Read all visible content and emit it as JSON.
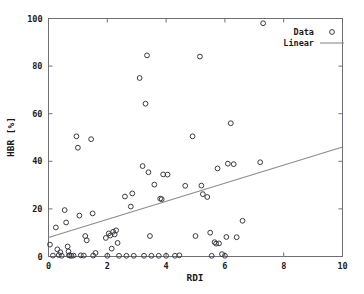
{
  "chart_data": {
    "type": "scatter",
    "title": "",
    "xlabel": "RDI",
    "ylabel": "HBR [%]",
    "xlim": [
      0,
      10
    ],
    "ylim": [
      0,
      100
    ],
    "xticks": [
      0,
      2,
      4,
      6,
      8,
      10
    ],
    "yticks": [
      0,
      20,
      40,
      60,
      80,
      100
    ],
    "xticklabels": [
      "0",
      "2",
      "4",
      "6",
      "8",
      "10"
    ],
    "yticklabels": [
      "0",
      "20",
      "40",
      "60",
      "80",
      "100"
    ],
    "grid": false,
    "legend_position": "upper right",
    "series": [
      {
        "name": "Data",
        "type": "scatter",
        "marker": "circle-open",
        "color": "#3a3a44",
        "points": [
          [
            0.05,
            5.0
          ],
          [
            0.15,
            0.4
          ],
          [
            0.25,
            12.2
          ],
          [
            0.3,
            3.0
          ],
          [
            0.35,
            0.6
          ],
          [
            0.4,
            1.8
          ],
          [
            0.45,
            0.3
          ],
          [
            0.55,
            19.5
          ],
          [
            0.6,
            14.3
          ],
          [
            0.65,
            4.2
          ],
          [
            0.68,
            2.1
          ],
          [
            0.7,
            0.5
          ],
          [
            0.72,
            0.4
          ],
          [
            0.78,
            0.3
          ],
          [
            0.85,
            0.4
          ],
          [
            0.95,
            50.5
          ],
          [
            1.0,
            45.7
          ],
          [
            1.05,
            17.2
          ],
          [
            1.1,
            0.5
          ],
          [
            1.2,
            0.4
          ],
          [
            1.25,
            8.6
          ],
          [
            1.3,
            6.8
          ],
          [
            1.45,
            49.3
          ],
          [
            1.5,
            18.1
          ],
          [
            1.52,
            0.4
          ],
          [
            1.6,
            1.5
          ],
          [
            1.95,
            7.8
          ],
          [
            2.0,
            0.3
          ],
          [
            2.05,
            9.7
          ],
          [
            2.1,
            8.8
          ],
          [
            2.15,
            3.3
          ],
          [
            2.2,
            10.4
          ],
          [
            2.25,
            9.3
          ],
          [
            2.3,
            11.0
          ],
          [
            2.35,
            5.7
          ],
          [
            2.4,
            0.3
          ],
          [
            2.6,
            25.2
          ],
          [
            2.65,
            0.3
          ],
          [
            2.8,
            21.0
          ],
          [
            2.85,
            26.5
          ],
          [
            2.9,
            0.3
          ],
          [
            3.1,
            75.0
          ],
          [
            3.2,
            38.0
          ],
          [
            3.25,
            0.3
          ],
          [
            3.3,
            64.2
          ],
          [
            3.35,
            84.5
          ],
          [
            3.4,
            35.4
          ],
          [
            3.45,
            8.6
          ],
          [
            3.5,
            0.3
          ],
          [
            3.6,
            30.2
          ],
          [
            3.75,
            0.3
          ],
          [
            3.8,
            24.3
          ],
          [
            3.85,
            24.1
          ],
          [
            3.9,
            34.5
          ],
          [
            4.0,
            0.3
          ],
          [
            4.05,
            34.4
          ],
          [
            4.3,
            0.3
          ],
          [
            4.45,
            0.5
          ],
          [
            4.65,
            29.7
          ],
          [
            4.9,
            50.5
          ],
          [
            5.0,
            8.6
          ],
          [
            5.15,
            84.0
          ],
          [
            5.2,
            29.8
          ],
          [
            5.25,
            26.2
          ],
          [
            5.4,
            25.0
          ],
          [
            5.5,
            10.0
          ],
          [
            5.55,
            0.3
          ],
          [
            5.65,
            6.0
          ],
          [
            5.7,
            5.4
          ],
          [
            5.75,
            37.0
          ],
          [
            5.8,
            5.5
          ],
          [
            5.9,
            1.0
          ],
          [
            6.0,
            0.3
          ],
          [
            6.05,
            8.2
          ],
          [
            6.1,
            39.0
          ],
          [
            6.2,
            56.0
          ],
          [
            6.3,
            38.8
          ],
          [
            6.4,
            8.1
          ],
          [
            6.6,
            15.0
          ],
          [
            7.2,
            39.6
          ],
          [
            7.3,
            98.0
          ]
        ]
      },
      {
        "name": "Linear",
        "type": "line",
        "color": "#8a8a92",
        "fit": {
          "x0": 0,
          "y0": 8.0,
          "x1": 10,
          "y1": 46.0
        }
      }
    ]
  },
  "legend": {
    "entries": [
      {
        "label": "Data",
        "marker": "circle-open"
      },
      {
        "label": "Linear",
        "marker": "line"
      }
    ]
  }
}
